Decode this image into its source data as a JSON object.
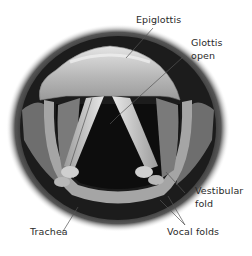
{
  "figure": {
    "labels": {
      "epiglottis": "Epiglottis",
      "glottis_line1": "Glottis",
      "glottis_line2": "open",
      "vestibular_line1": "Vestibular",
      "vestibular_line2": "fold",
      "trachea": "Trachea",
      "vocal_folds": "Vocal folds"
    },
    "colors": {
      "background": "#ffffff",
      "dark_rim": "#1a1a1a",
      "epiglottis": "#c8c8c8",
      "folds": "#d9d9d9",
      "airway": "#0a0a0a",
      "leader": "#555555",
      "text": "#2a2a2a"
    }
  }
}
